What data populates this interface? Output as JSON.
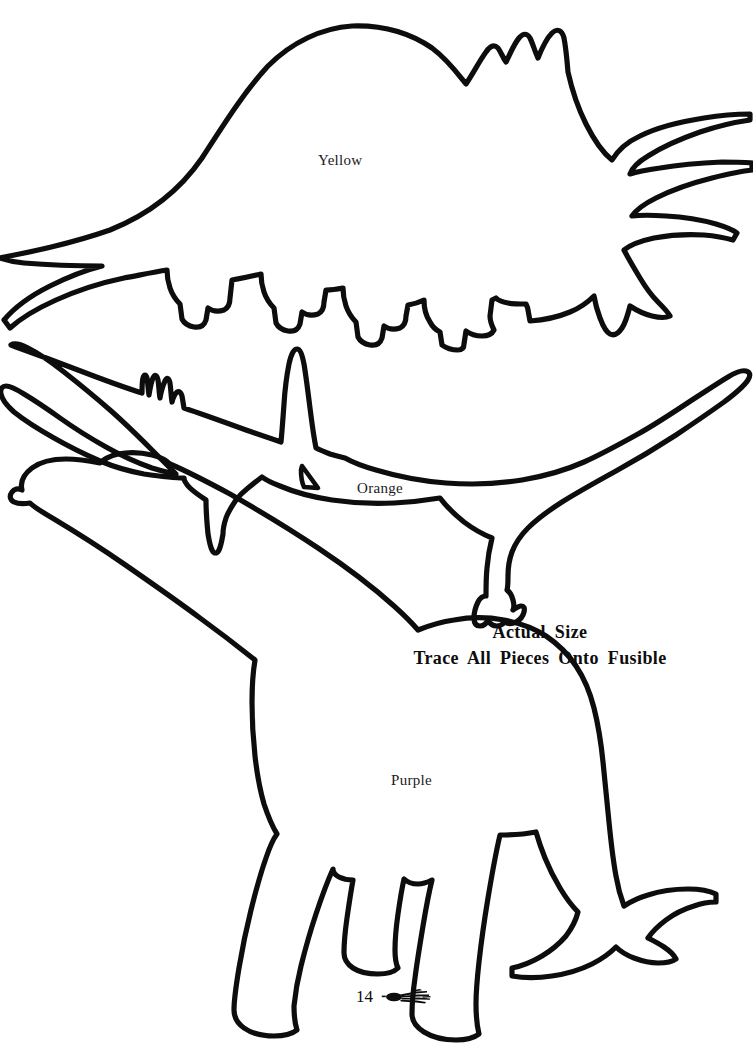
{
  "page": {
    "width": 753,
    "height": 1050,
    "background_color": "#ffffff",
    "ink_color": "#0d0d0d",
    "page_number": "14",
    "ornament_icon": "needle-and-thread-ornament"
  },
  "instructions": {
    "line1": "Actual  Size",
    "line2": "Trace  All  Pieces  Onto  Fusible"
  },
  "patterns": [
    {
      "id": "triceratops",
      "label": "Yellow",
      "shape_name": "triceratops-outline",
      "position": "top"
    },
    {
      "id": "pterodactyl",
      "label": "Orange",
      "shape_name": "pterodactyl-outline",
      "position": "middle"
    },
    {
      "id": "brontosaurus",
      "label": "Purple",
      "shape_name": "brontosaurus-outline",
      "position": "bottom"
    }
  ],
  "labels": {
    "yellow": "Yellow",
    "orange": "Orange",
    "purple": "Purple"
  }
}
